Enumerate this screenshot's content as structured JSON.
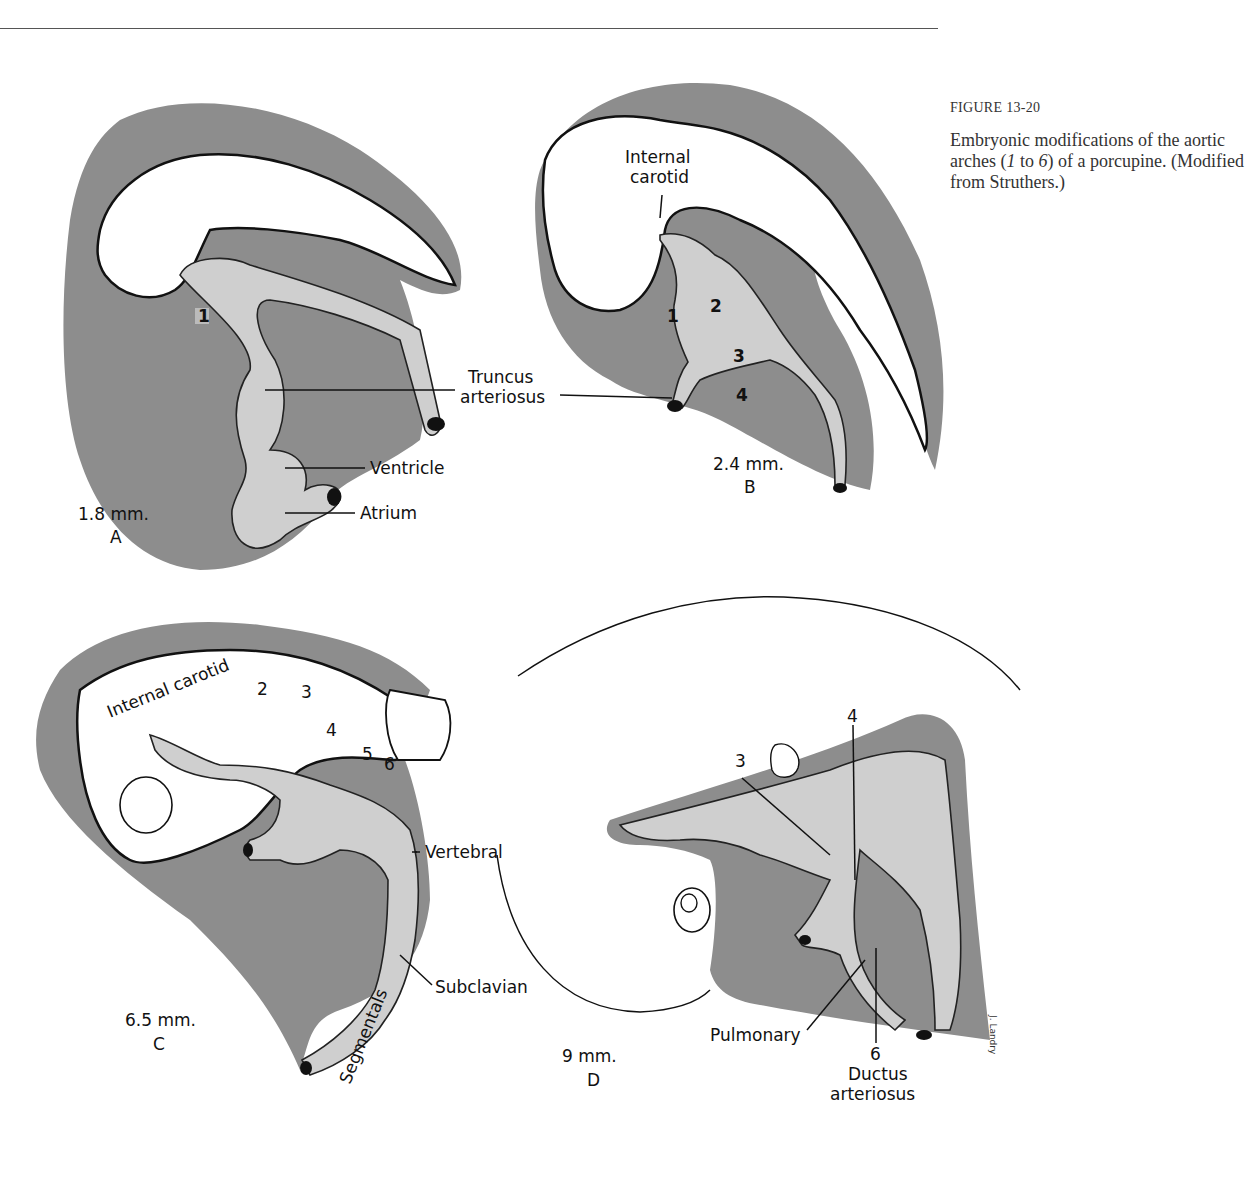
{
  "page": {
    "figure_number": "FIGURE 13-20",
    "caption_parts": [
      "Embryonic modifications of the aortic arches (",
      "1",
      " to ",
      "6",
      ") of a porcupine. (Modified from Struthers.)"
    ]
  },
  "panels": {
    "A": {
      "size": "1.8 mm.",
      "letter": "A",
      "arch_numbers": [
        "1"
      ],
      "labels": {
        "truncus_1": "Truncus",
        "truncus_2": "arteriosus",
        "ventricle": "Ventricle",
        "atrium": "Atrium"
      }
    },
    "B": {
      "size": "2.4 mm.",
      "letter": "B",
      "arch_numbers": [
        "1",
        "2",
        "3",
        "4"
      ],
      "labels": {
        "internal_carotid_1": "Internal",
        "internal_carotid_2": "carotid"
      }
    },
    "C": {
      "size": "6.5 mm.",
      "letter": "C",
      "arch_numbers": [
        "2",
        "3",
        "4",
        "5",
        "6"
      ],
      "labels": {
        "internal_carotid": "Internal carotid",
        "vertebral": "Vertebral",
        "subclavian": "Subclavian",
        "segmentals": "Segmentals"
      }
    },
    "D": {
      "size": "9 mm.",
      "letter": "D",
      "arch_numbers": [
        "3",
        "4",
        "6"
      ],
      "labels": {
        "pulmonary": "Pulmonary",
        "ductus_1": "Ductus",
        "ductus_2": "arteriosus"
      },
      "signature": "J. Landry"
    }
  }
}
